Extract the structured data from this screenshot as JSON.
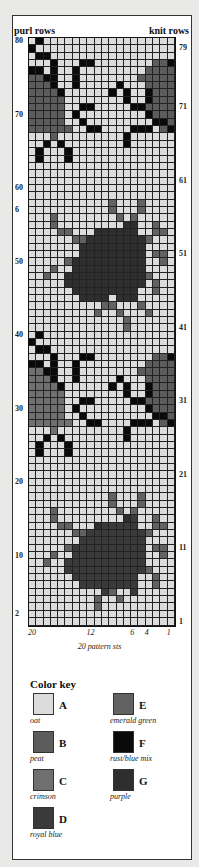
{
  "header": {
    "left_label": "purl rows",
    "right_label": "knit rows"
  },
  "row_labels_left": [
    {
      "text": "80",
      "row": 80
    },
    {
      "text": "70",
      "row": 70
    },
    {
      "text": "60",
      "row": 60
    },
    {
      "text": "6",
      "row": 57
    },
    {
      "text": "50",
      "row": 50
    },
    {
      "text": "40",
      "row": 40
    },
    {
      "text": "30",
      "row": 30
    },
    {
      "text": "20",
      "row": 20
    },
    {
      "text": "10",
      "row": 10
    },
    {
      "text": "2",
      "row": 2
    }
  ],
  "row_labels_right": [
    {
      "text": "79",
      "row": 79
    },
    {
      "text": "71",
      "row": 71
    },
    {
      "text": "61",
      "row": 61
    },
    {
      "text": "51",
      "row": 51
    },
    {
      "text": "41",
      "row": 41
    },
    {
      "text": "31",
      "row": 31
    },
    {
      "text": "21",
      "row": 21
    },
    {
      "text": "11",
      "row": 11
    },
    {
      "text": "1",
      "row": 1
    }
  ],
  "stitch_labels": [
    {
      "text": "20",
      "st": 20
    },
    {
      "text": "12",
      "st": 12
    },
    {
      "text": "6",
      "st": 6
    },
    {
      "text": "4",
      "st": 4
    },
    {
      "text": "1",
      "st": 1
    }
  ],
  "caption": "20 pattern sts",
  "colors": {
    "A": "#dcdcdc",
    "B": "#5c5c5c",
    "C": "#707070",
    "D": "#3a3a3a",
    "E": "#626262",
    "F": "#0a0a0a",
    "G": "#2e2e2e"
  },
  "color_key": {
    "title": "Color key",
    "items": [
      {
        "letter": "A",
        "name": "oat"
      },
      {
        "letter": "B",
        "name": "peat"
      },
      {
        "letter": "C",
        "name": "crimson"
      },
      {
        "letter": "D",
        "name": "royal blue"
      },
      {
        "letter": "E",
        "name": "emerald green"
      },
      {
        "letter": "F",
        "name": "rust/blue mix"
      },
      {
        "letter": "G",
        "name": "purple"
      }
    ]
  },
  "chart_grid": {
    "rows_total": 80,
    "stitches": 20,
    "note": "rows listed from row 80 (top) to row 1 (bottom); characters from stitch 20 (left) to stitch 1 (right)",
    "rows": [
      "AFAAAAAAAAAAAAAAAAAA",
      "FAAAAAAAAAAAAAAAAAAA",
      "AFFAAAAAAAAAAAAAAAAA",
      "AAAFAAAFFAAAAAAAABBF",
      "FFAFAAFAAAAAAAAABBBB",
      "BBFFAAFAAAAAAAABBBBB",
      "BBBFAAFAAAAAFAAABBBB",
      "BBBBFAAAAAAFAFAAFBBB",
      "BBBBBAAAAAAAAFAAFBBB",
      "BBBBBAAFFAAAAAFFBBBB",
      "BBBBBAFAAAAAAAAAFBBB",
      "BBBBBAAFAAAAAAAAAFFB",
      "BBBBBBAAFFAAAAFFFABF",
      "AAABAAAAAAAAAFAAAAAA",
      "AAFAFAAAAAAAAFAAAAAA",
      "AFAAAFAAAAAAAAAAAAAA",
      "AFAAAFAAAAAAAAAAAAAA",
      "AAAAAAAAAAAAAAAAAAAA",
      "AAAAAAAAAAAAAAAAAAAA",
      "AAAAAAAAAAAAAAAAAAAA",
      "AAAAAAAAAAAAAAAAAAAA",
      "AAAAAAAAAAAAAAAAAAAA",
      "AAAAAAAAAAAEAAAEAAAA",
      "AAAAAAAAAAAEAAAEAAAA",
      "AAAEAAAAAAAAEAEAAAAA",
      "AAAEAAAAAAAAAGGAAEAA",
      "AAAAEEAAAGGGGGGAAEEA",
      "AAAAAAEEGGGGGGGGEAAA",
      "AAAAAAAGGGGGGGGGAAAA",
      "AAAAAAAGGGGGGGGGAEEA",
      "AAAAAEGGGGGGGGGGAAEA",
      "AAAEAAGGGGGGGGGGAAAA",
      "AAEAAGGGGGGGGGGGEAAA",
      "AAAAAGGGGGGGGGGGAEAA",
      "AAAAAAGGGGGGGGGAAEAA",
      "AAAAAAAGGGGAGGGAAAAA",
      "AAAAAAAAAAEEAAAEAAAA",
      "AAAAAAAAAEAAEAAAEAAA",
      "AAAAAAAAAAAAAEAAAAAA",
      "AAAAAAAAAAAAAEAAAAAA",
      "AFAAAAAAAAAAAAAAAAAA",
      "FAAAAAAAAAAAAAAAAAAA",
      "AFFAAAAAAAAAAAAAAAAA",
      "AAAFAAAFFAAAAAAAABBF",
      "FFAFAAFAAAAAAAAABBBB",
      "CCFFAAFAAAAAAAABBBBB",
      "CCCFAAFAAAAAFAAABBBB",
      "CCCCFAAAAAAFAFAAFBBB",
      "CCCCCAAAAAAAAFAAFBBB",
      "CCCCCAAFFAAAAAFFBBBB",
      "CCCCCAFAAAAAAAAAFBBB",
      "CCCCCAAFAAAAAAAAAFFB",
      "CCCCCCAAFFAAAAFFFABF",
      "AAACAAAAAAAAAFAAAAAA",
      "AAFAFAAAAAAAAFAAAAAA",
      "AFAAAFAAAAAAAAAAAAAA",
      "AFAAAFAAAAAAAAAAAAAA",
      "AAAAAAAAAAAAAAAAAAAA",
      "AAAAAAAAAAAAAAAAAAAA",
      "AAAAAAAAAAAAAAAAAAAA",
      "AAAAAAAAAAAAAAAAAAAA",
      "AAAAAAAAAAAAAAAAAAAA",
      "AAAAAAAAAAAEAAAEAAAA",
      "AAAAAAAAAAAEAAAEAAAA",
      "AAAEAAAAAAAAEAEAAAAA",
      "AAAEAAAAAAAAAGDAAEAA",
      "AAAAEEAAAGDDDDDAAEEA",
      "AAAAAAEEDDDDDDDDEAAA",
      "AAAAAAADDDDDDDDDAAAA",
      "AAAAAEDDDDDDDDDDAEEA",
      "AAAEAADDDDDDDDDDAAEA",
      "AAEAADDDDDDDDDDDAAAA",
      "AAAAADDDDDDDDDDDEAAA",
      "AAAAAADDDDDDDDDAAEAA",
      "AAAAAAADDDDDDDDAAEAA",
      "AAAAAAAAAADEAADAAAAA",
      "AAAAAAAAAEAAEAAAAAAA",
      "AAAAAAAAAEAAAAAAAAAA",
      "AAAAAAAAAAAAAAAAAAAA",
      "AAAAAAAAAAAAAAAAAAAA"
    ]
  }
}
